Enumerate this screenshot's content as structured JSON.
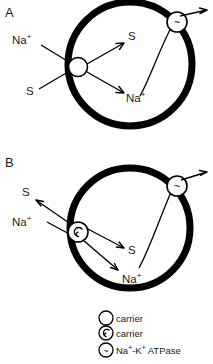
{
  "figure": {
    "type": "biological-diagram",
    "background_color": "#ffffff",
    "line_color": "#000000"
  },
  "panels": [
    {
      "id": "A",
      "label": "A",
      "membrane_shape": "circle",
      "carrier_type": "carrier",
      "labels_outside": [
        {
          "name": "sodium-outside",
          "text": "Na",
          "sup": "+"
        },
        {
          "name": "substrate-outside",
          "text": "S",
          "sup": ""
        }
      ],
      "labels_inside": [
        {
          "name": "substrate-inside",
          "text": "S",
          "sup": ""
        },
        {
          "name": "sodium-inside",
          "text": "Na",
          "sup": "+"
        }
      ],
      "pump": {
        "name": "atpase",
        "glyph": "~"
      },
      "transport_direction": "inward"
    },
    {
      "id": "B",
      "label": "B",
      "membrane_shape": "circle",
      "carrier_type": "carrier-alternate",
      "labels_outside": [
        {
          "name": "substrate-outside",
          "text": "S",
          "sup": ""
        },
        {
          "name": "sodium-outside",
          "text": "Na",
          "sup": "+"
        }
      ],
      "labels_inside": [
        {
          "name": "substrate-inside",
          "text": "S",
          "sup": ""
        },
        {
          "name": "sodium-inside",
          "text": "Na",
          "sup": "+"
        }
      ],
      "pump": {
        "name": "atpase",
        "glyph": "~"
      },
      "transport_direction": "bidirectional"
    }
  ],
  "legend": {
    "items": [
      {
        "icon": "open-circle-icon",
        "label": "carrier",
        "sup": ""
      },
      {
        "icon": "spiral-circle-icon",
        "label": "carrier",
        "sup": ""
      },
      {
        "icon": "tilde-circle-icon",
        "label_prefix": "Na",
        "sup1": "+",
        "label_mid": "-K",
        "sup2": "+",
        "label_suffix": " ATPase",
        "glyph": "~"
      }
    ]
  }
}
